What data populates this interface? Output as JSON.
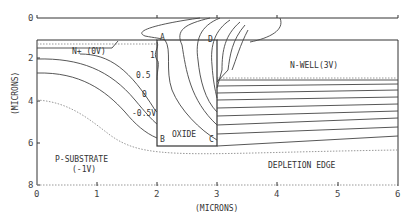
{
  "figure": {
    "type": "device-cross-section-potential-contours",
    "x_axis": {
      "label": "(MICRONS)",
      "ticks": [
        "0",
        "1",
        "2",
        "3",
        "4",
        "5",
        "6"
      ],
      "range": [
        0,
        6
      ]
    },
    "y_axis": {
      "label": "(MICRONS)",
      "ticks": [
        "2",
        "4",
        "6",
        "8"
      ],
      "range": [
        0,
        8
      ]
    },
    "top_axis": {
      "tick": "0"
    },
    "regions": {
      "n_plus": "N+ (0V)",
      "n_well": "N-WELL(3V)",
      "oxide": "OXIDE",
      "substrate_line1": "P-SUBSTRATE",
      "substrate_line2": "(-1V)",
      "depletion": "DEPLETION EDGE"
    },
    "corners": {
      "a": "A",
      "b": "B",
      "c": "C",
      "d": "D"
    },
    "contour_labels": [
      "1",
      "0.5",
      "0",
      "-0.5V"
    ]
  }
}
